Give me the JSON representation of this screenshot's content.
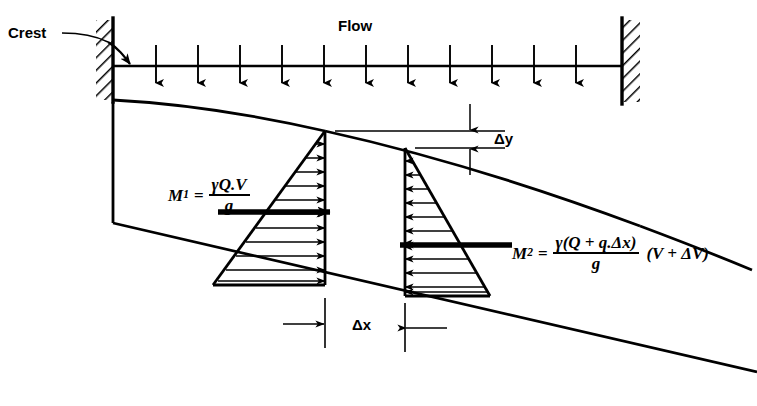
{
  "figure": {
    "title_label": "Flow",
    "crest_label": "Crest",
    "delta_y_label": "Δy",
    "delta_x_label": "Δx",
    "colors": {
      "ink": "#000000",
      "background": "#ffffff"
    }
  },
  "momentum_left": {
    "symbol": "M",
    "subscript": "1",
    "equals": "=",
    "numerator": "γQ.V",
    "denominator": "g",
    "suffix": ""
  },
  "momentum_right": {
    "symbol": "M",
    "subscript": "2",
    "equals": "=",
    "numerator": "γ(Q + q.Δx)",
    "denominator": "g",
    "suffix": "(V + ΔV)"
  },
  "elements": {
    "inflow_arrow_count": 11,
    "left_pressure_arrow_count": 11,
    "right_pressure_arrow_count": 11,
    "left_wall_label": "left-abutment-wall",
    "right_wall_label": "right-abutment-wall",
    "water_surface_label": "water-surface-profile",
    "channel_bed_label": "channel-bed-line"
  }
}
